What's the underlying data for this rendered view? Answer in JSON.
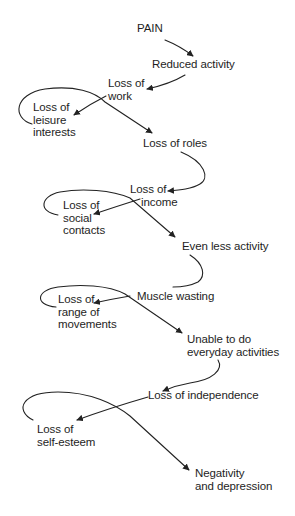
{
  "diagram": {
    "type": "flow-chain",
    "colors": {
      "text": "#1e1e1e",
      "line": "#222222",
      "background": "#ffffff"
    },
    "nodes": [
      {
        "id": "pain",
        "lines": [
          "PAIN"
        ]
      },
      {
        "id": "reduced-activity",
        "lines": [
          "Reduced activity"
        ]
      },
      {
        "id": "loss-of-work",
        "lines": [
          "Loss of",
          "work"
        ]
      },
      {
        "id": "loss-of-leisure-interests",
        "lines": [
          "Loss of",
          "leisure",
          "interests"
        ]
      },
      {
        "id": "loss-of-roles",
        "lines": [
          "Loss of roles"
        ]
      },
      {
        "id": "loss-of-income",
        "lines": [
          "Loss of",
          "income"
        ]
      },
      {
        "id": "loss-of-social-contacts",
        "lines": [
          "Loss of",
          "social",
          "contacts"
        ]
      },
      {
        "id": "even-less-activity",
        "lines": [
          "Even less activity"
        ]
      },
      {
        "id": "muscle-wasting",
        "lines": [
          "Muscle wasting"
        ]
      },
      {
        "id": "loss-of-range-of-movements",
        "lines": [
          "Loss of",
          "range of",
          "movements"
        ]
      },
      {
        "id": "unable-everyday-activities",
        "lines": [
          "Unable to do",
          "everyday activities"
        ]
      },
      {
        "id": "loss-of-independence",
        "lines": [
          "Loss of independence"
        ]
      },
      {
        "id": "loss-of-self-esteem",
        "lines": [
          "Loss of",
          "self-esteem"
        ]
      },
      {
        "id": "negativity-depression",
        "lines": [
          "Negativity",
          "and depression"
        ]
      }
    ],
    "edges": [
      {
        "from": "pain",
        "to": "reduced-activity"
      },
      {
        "from": "reduced-activity",
        "to": "loss-of-work"
      },
      {
        "from": "loss-of-work",
        "to": "loss-of-leisure-interests"
      },
      {
        "from": "loss-of-leisure-interests",
        "to": "loss-of-roles"
      },
      {
        "from": "loss-of-roles",
        "to": "loss-of-income"
      },
      {
        "from": "loss-of-income",
        "to": "loss-of-social-contacts"
      },
      {
        "from": "loss-of-social-contacts",
        "to": "even-less-activity"
      },
      {
        "from": "even-less-activity",
        "to": "muscle-wasting"
      },
      {
        "from": "muscle-wasting",
        "to": "loss-of-range-of-movements"
      },
      {
        "from": "loss-of-range-of-movements",
        "to": "unable-everyday-activities"
      },
      {
        "from": "unable-everyday-activities",
        "to": "loss-of-independence"
      },
      {
        "from": "loss-of-independence",
        "to": "loss-of-self-esteem"
      },
      {
        "from": "loss-of-self-esteem",
        "to": "negativity-depression"
      }
    ]
  }
}
